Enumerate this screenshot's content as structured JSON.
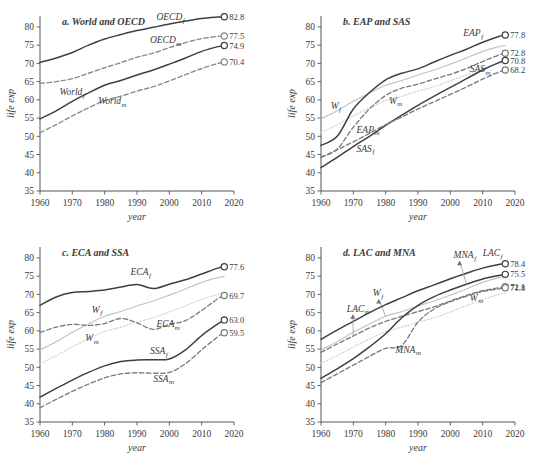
{
  "figure": {
    "width": 559,
    "height": 466,
    "background": "#ffffff"
  },
  "axes": {
    "xlabel": "year",
    "ylabel": "life exp",
    "xlim": [
      1960,
      2020
    ],
    "ylim": [
      35,
      83
    ],
    "xticks": [
      1960,
      1970,
      1980,
      1990,
      2000,
      2010,
      2020
    ],
    "xtick_labels": [
      "1960",
      "1970",
      "1980",
      "1990",
      "2000",
      "2010",
      "2020"
    ],
    "yticks": [
      35,
      40,
      45,
      50,
      55,
      60,
      65,
      70,
      75,
      80
    ],
    "ytick_labels": [
      "35",
      "40",
      "45",
      "50",
      "55",
      "60",
      "65",
      "70",
      "75",
      "80"
    ],
    "grid": false,
    "legend": "inline-labels"
  },
  "colors": {
    "female_solid": "#3f3f3f",
    "male_dashed": "#6e6e6e",
    "world_female_ref": "#bdbdbd",
    "world_male_ref": "#d2d2d2",
    "axis": "#555555",
    "text": "#3a3a3a"
  },
  "chart_data": [
    {
      "id": "panel-a",
      "type": "line",
      "title": "a. World and OECD",
      "xlabel": "year",
      "ylabel": "life exp",
      "xlim": [
        1960,
        2020
      ],
      "ylim": [
        35,
        83
      ],
      "grid": false,
      "x": [
        1960,
        1965,
        1970,
        1975,
        1980,
        1985,
        1990,
        1995,
        2000,
        2005,
        2010,
        2015,
        2017
      ],
      "series": [
        {
          "name": "OECD_f",
          "label": "OECD",
          "sub": "f",
          "style": "solid",
          "color": "#3f3f3f",
          "values": [
            70.3,
            71.5,
            73.0,
            75.0,
            76.7,
            77.9,
            79.0,
            79.9,
            80.8,
            81.6,
            82.3,
            82.7,
            82.8
          ],
          "end_value": 82.8,
          "label_x": 1996,
          "label_y": 81.8
        },
        {
          "name": "OECD_m",
          "label": "OECD",
          "sub": "m",
          "style": "dashed",
          "color": "#8a8a8a",
          "values": [
            64.5,
            65.0,
            65.8,
            67.3,
            68.8,
            70.2,
            71.7,
            72.8,
            74.3,
            75.7,
            76.8,
            77.4,
            77.5
          ],
          "end_value": 77.5,
          "label_x": 1994,
          "label_y": 75.6
        },
        {
          "name": "World_f",
          "label": "World",
          "sub": "f",
          "style": "solid",
          "color": "#3f3f3f",
          "values": [
            54.8,
            57.0,
            59.6,
            61.9,
            64.0,
            65.3,
            66.8,
            68.2,
            69.8,
            71.5,
            73.3,
            74.6,
            74.9
          ],
          "end_value": 74.9,
          "label_x": 1966,
          "label_y": 61.2
        },
        {
          "name": "World_m",
          "label": "World",
          "sub": "m",
          "style": "dashed",
          "color": "#8a8a8a",
          "values": [
            51.0,
            53.2,
            55.6,
            57.8,
            59.8,
            61.0,
            62.4,
            63.6,
            65.2,
            66.9,
            68.6,
            70.0,
            70.4
          ],
          "end_value": 70.4,
          "label_x": 1978,
          "label_y": 58.8
        }
      ]
    },
    {
      "id": "panel-b",
      "type": "line",
      "title": "b. EAP and SAS",
      "xlabel": "year",
      "ylabel": "life exp",
      "xlim": [
        1960,
        2020
      ],
      "ylim": [
        35,
        83
      ],
      "grid": false,
      "x": [
        1960,
        1965,
        1970,
        1975,
        1980,
        1985,
        1990,
        1995,
        2000,
        2005,
        2010,
        2015,
        2017
      ],
      "series": [
        {
          "name": "W_f",
          "label": "W",
          "sub": "f",
          "style": "solid-light",
          "color": "#c2c2c2",
          "values": [
            54.8,
            57.0,
            59.6,
            61.9,
            64.0,
            65.3,
            66.8,
            68.2,
            69.8,
            71.5,
            73.3,
            74.6,
            74.9
          ],
          "end_value": null,
          "label_x": 1963,
          "label_y": 57.5
        },
        {
          "name": "W_m",
          "label": "W",
          "sub": "m",
          "style": "dotted-light",
          "color": "#d4d4d4",
          "values": [
            51.0,
            53.2,
            55.6,
            57.8,
            59.8,
            61.0,
            62.4,
            63.6,
            65.2,
            66.9,
            68.6,
            70.0,
            70.4
          ],
          "end_value": null,
          "label_x": 1981,
          "label_y": 59.0
        },
        {
          "name": "EAP_f",
          "label": "EAP",
          "sub": "f",
          "style": "solid",
          "color": "#3f3f3f",
          "values": [
            47.5,
            50.0,
            57.5,
            62.0,
            65.5,
            67.3,
            68.5,
            70.4,
            72.2,
            73.9,
            75.8,
            77.4,
            77.8
          ],
          "end_value": 77.8,
          "label_x": 2004,
          "label_y": 77.4
        },
        {
          "name": "EAP_m",
          "label": "EAP",
          "sub": "m",
          "style": "dashed",
          "color": "#7b7b7b",
          "values": [
            44.3,
            46.5,
            52.5,
            57.5,
            61.2,
            63.2,
            64.3,
            65.7,
            67.0,
            68.6,
            70.5,
            72.3,
            72.8
          ],
          "end_value": 72.8,
          "label_x": 1971,
          "label_y": 51.0
        },
        {
          "name": "SAS_f",
          "label": "SAS",
          "sub": "f",
          "style": "solid",
          "color": "#3f3f3f",
          "values": [
            41.4,
            44.2,
            47.2,
            50.0,
            53.0,
            55.8,
            58.5,
            61.0,
            63.4,
            65.8,
            68.2,
            70.2,
            70.8
          ],
          "end_value": 70.8,
          "label_x": 1971,
          "label_y": 45.8
        },
        {
          "name": "SAS_m",
          "label": "SAS",
          "sub": "m",
          "style": "dashed",
          "color": "#7b7b7b",
          "values": [
            44.2,
            46.3,
            48.5,
            50.8,
            53.2,
            55.3,
            57.5,
            59.5,
            61.5,
            63.5,
            65.7,
            67.6,
            68.2
          ],
          "end_value": 68.2,
          "label_x": 2006,
          "label_y": 67.6
        }
      ]
    },
    {
      "id": "panel-c",
      "type": "line",
      "title": "c. ECA and SSA",
      "xlabel": "year",
      "ylabel": "life exp",
      "xlim": [
        1960,
        2020
      ],
      "ylim": [
        35,
        83
      ],
      "grid": false,
      "x": [
        1960,
        1965,
        1970,
        1975,
        1980,
        1985,
        1990,
        1995,
        2000,
        2005,
        2010,
        2015,
        2017
      ],
      "series": [
        {
          "name": "W_f",
          "label": "W",
          "sub": "f",
          "style": "solid-light",
          "color": "#c2c2c2",
          "values": [
            54.8,
            57.0,
            59.6,
            61.9,
            64.0,
            65.3,
            66.8,
            68.2,
            69.8,
            71.5,
            73.3,
            74.6,
            74.9
          ],
          "end_value": null,
          "label_x": 1976,
          "label_y": 65.0
        },
        {
          "name": "W_m",
          "label": "W",
          "sub": "m",
          "style": "dotted-light",
          "color": "#d4d4d4",
          "values": [
            51.0,
            53.2,
            55.6,
            57.8,
            59.8,
            61.0,
            62.4,
            63.6,
            65.2,
            66.9,
            68.6,
            70.0,
            70.4
          ],
          "end_value": null,
          "label_x": 1974,
          "label_y": 57.2
        },
        {
          "name": "ECA_f",
          "label": "ECA",
          "sub": "f",
          "style": "solid",
          "color": "#3f3f3f",
          "values": [
            67.0,
            69.3,
            70.5,
            70.8,
            71.2,
            72.0,
            72.7,
            71.6,
            72.8,
            74.0,
            75.6,
            77.2,
            77.6
          ],
          "end_value": 77.6,
          "label_x": 1988,
          "label_y": 75.2
        },
        {
          "name": "ECA_m",
          "label": "ECA",
          "sub": "m",
          "style": "dashed",
          "color": "#7b7b7b",
          "values": [
            59.6,
            61.0,
            61.8,
            61.5,
            62.0,
            63.4,
            62.2,
            60.4,
            61.8,
            62.8,
            65.6,
            68.8,
            69.7
          ],
          "end_value": 69.7,
          "label_x": 1996,
          "label_y": 61.0
        },
        {
          "name": "SSA_f",
          "label": "SSA",
          "sub": "f",
          "style": "solid",
          "color": "#3f3f3f",
          "values": [
            41.8,
            44.2,
            46.5,
            48.6,
            50.4,
            51.6,
            52.0,
            52.1,
            52.3,
            54.8,
            58.7,
            61.9,
            63.0
          ],
          "end_value": 63.0,
          "label_x": 1994,
          "label_y": 53.6
        },
        {
          "name": "SSA_m",
          "label": "SSA",
          "sub": "m",
          "style": "dashed",
          "color": "#7b7b7b",
          "values": [
            38.9,
            41.2,
            43.4,
            45.4,
            47.1,
            48.2,
            48.5,
            48.4,
            48.6,
            51.0,
            54.8,
            58.4,
            59.5
          ],
          "end_value": 59.5,
          "label_x": 1995,
          "label_y": 46.0
        }
      ]
    },
    {
      "id": "panel-d",
      "type": "line",
      "title": "d. LAC and MNA",
      "xlabel": "year",
      "ylabel": "life exp",
      "xlim": [
        1960,
        2020
      ],
      "ylim": [
        35,
        83
      ],
      "grid": false,
      "x": [
        1960,
        1965,
        1970,
        1975,
        1980,
        1985,
        1990,
        1995,
        2000,
        2005,
        2010,
        2015,
        2017
      ],
      "series": [
        {
          "name": "W_f",
          "label": "W",
          "sub": "f",
          "style": "solid-light",
          "color": "#c2c2c2",
          "values": [
            54.8,
            57.0,
            59.6,
            61.9,
            64.0,
            65.3,
            66.8,
            68.2,
            69.8,
            71.5,
            73.3,
            74.6,
            74.9
          ],
          "end_value": null,
          "label_x": 1976,
          "label_y": 69.5,
          "leader": true
        },
        {
          "name": "W_m",
          "label": "W",
          "sub": "m",
          "style": "dotted-light",
          "color": "#d4d4d4",
          "values": [
            51.0,
            53.2,
            55.6,
            57.8,
            59.8,
            61.0,
            62.4,
            63.6,
            65.2,
            66.9,
            68.6,
            70.0,
            70.4
          ],
          "end_value": null,
          "label_x": 2006,
          "label_y": 68.3
        },
        {
          "name": "LAC_f",
          "label": "LAC",
          "sub": "f",
          "style": "solid",
          "color": "#3f3f3f",
          "values": [
            57.7,
            60.2,
            62.6,
            65.0,
            67.2,
            69.1,
            71.0,
            72.6,
            74.3,
            75.8,
            77.2,
            78.2,
            78.4
          ],
          "end_value": 78.4,
          "label_x": 2010,
          "label_y": 80.5
        },
        {
          "name": "LAC_m",
          "label": "LAC",
          "sub": "m",
          "style": "dashed",
          "color": "#7b7b7b",
          "values": [
            54.1,
            56.4,
            58.6,
            60.8,
            62.6,
            64.0,
            65.3,
            66.6,
            68.2,
            69.7,
            71.0,
            71.8,
            72.1
          ],
          "end_value": 72.1,
          "label_x": 1968,
          "label_y": 65.3,
          "leader": true
        },
        {
          "name": "MNA_f",
          "label": "MNA",
          "sub": "f",
          "style": "solid",
          "color": "#3f3f3f",
          "values": [
            47.0,
            49.6,
            52.4,
            55.6,
            59.2,
            63.6,
            67.0,
            69.4,
            71.2,
            72.8,
            74.2,
            75.2,
            75.5
          ],
          "end_value": 75.5,
          "label_x": 2001,
          "label_y": 80.0,
          "leader": true
        },
        {
          "name": "MNA_m",
          "label": "MNA",
          "sub": "m",
          "style": "dashed",
          "color": "#7b7b7b",
          "values": [
            45.8,
            48.2,
            50.6,
            53.0,
            55.2,
            56.0,
            62.4,
            66.0,
            68.0,
            69.5,
            70.8,
            71.5,
            71.8
          ],
          "end_value": 71.8,
          "label_x": 1983,
          "label_y": 54.0
        }
      ]
    }
  ]
}
